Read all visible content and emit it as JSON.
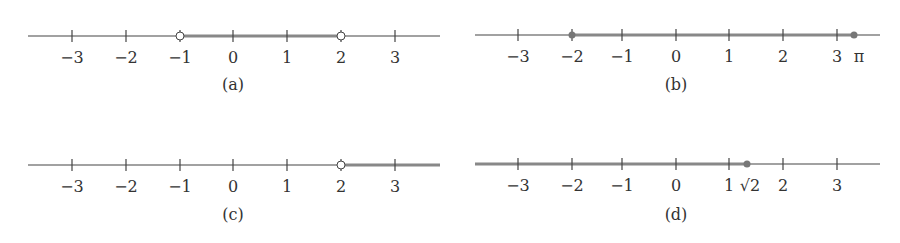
{
  "panels": [
    {
      "id": "a",
      "caption": "(a)",
      "axis": {
        "x0": 28,
        "x1": 440,
        "y": 36
      },
      "ticks": [
        {
          "x": 72,
          "label": "−3"
        },
        {
          "x": 126,
          "label": "−2"
        },
        {
          "x": 180,
          "label": "−1"
        },
        {
          "x": 233,
          "label": "0"
        },
        {
          "x": 287,
          "label": "1"
        },
        {
          "x": 341,
          "label": "2"
        },
        {
          "x": 395,
          "label": "3"
        }
      ],
      "interval": {
        "from": "-1",
        "to": "2",
        "left": "open",
        "right": "open",
        "x_from": 180,
        "x_to": 341
      },
      "caption_x": 233,
      "caption_y": 90
    },
    {
      "id": "b",
      "caption": "(b)",
      "axis": {
        "x0": 475,
        "x1": 880,
        "y": 35
      },
      "ticks": [
        {
          "x": 518,
          "label": "−3"
        },
        {
          "x": 572,
          "label": "−2"
        },
        {
          "x": 622,
          "label": "−1"
        },
        {
          "x": 676,
          "label": "0"
        },
        {
          "x": 729,
          "label": "1"
        },
        {
          "x": 783,
          "label": "2"
        },
        {
          "x": 837,
          "label": "3"
        }
      ],
      "extra_label": {
        "x": 859,
        "label": "π"
      },
      "interval": {
        "from": "-2",
        "to": "π",
        "left": "closed",
        "right": "closed",
        "x_from": 572,
        "x_to": 854
      },
      "caption_x": 676,
      "caption_y": 90
    },
    {
      "id": "c",
      "caption": "(c)",
      "axis": {
        "x0": 28,
        "x1": 440,
        "y": 165
      },
      "ticks": [
        {
          "x": 72,
          "label": "−3"
        },
        {
          "x": 126,
          "label": "−2"
        },
        {
          "x": 180,
          "label": "−1"
        },
        {
          "x": 233,
          "label": "0"
        },
        {
          "x": 287,
          "label": "1"
        },
        {
          "x": 341,
          "label": "2"
        },
        {
          "x": 395,
          "label": "3"
        }
      ],
      "interval": {
        "from": "2",
        "to": "∞",
        "left": "open",
        "right": "ray",
        "x_from": 341,
        "x_to": 440
      },
      "caption_x": 233,
      "caption_y": 220
    },
    {
      "id": "d",
      "caption": "(d)",
      "axis": {
        "x0": 475,
        "x1": 880,
        "y": 164
      },
      "ticks": [
        {
          "x": 518,
          "label": "−3"
        },
        {
          "x": 572,
          "label": "−2"
        },
        {
          "x": 622,
          "label": "−1"
        },
        {
          "x": 676,
          "label": "0"
        },
        {
          "x": 729,
          "label": "1"
        },
        {
          "x": 783,
          "label": "2"
        },
        {
          "x": 837,
          "label": "3"
        }
      ],
      "extra_label": {
        "x": 750,
        "label": "√2"
      },
      "interval": {
        "from": "-∞",
        "to": "√2",
        "left": "ray",
        "right": "closed",
        "x_from": 475,
        "x_to": 747
      },
      "caption_x": 676,
      "caption_y": 220
    }
  ],
  "colors": {
    "axis": "#444444",
    "interval": "#888888",
    "open_fill": "#ffffff",
    "dot": "#777777"
  }
}
